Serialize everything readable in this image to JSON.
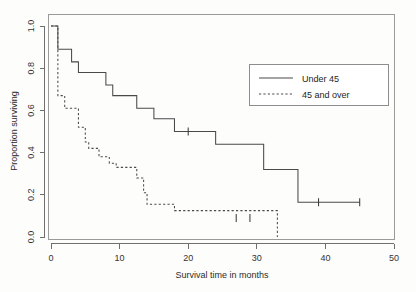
{
  "chart_data": {
    "type": "line",
    "title": "",
    "xlabel": "Survival time in months",
    "ylabel": "Proportion surviving",
    "xlim": [
      0,
      50
    ],
    "ylim": [
      0.0,
      1.0
    ],
    "xticks": [
      0,
      10,
      20,
      30,
      40,
      50
    ],
    "xtick_labels": [
      "0",
      "10",
      "20",
      "30",
      "40",
      "50"
    ],
    "yticks": [
      0.0,
      0.2,
      0.4,
      0.6,
      0.8,
      1.0
    ],
    "ytick_labels": [
      "0.0",
      "0.2",
      "0.4",
      "0.6",
      "0.8",
      "1.0"
    ],
    "grid": false,
    "legend_position": "top-right",
    "step_type": "post",
    "series": [
      {
        "name": "Under 45",
        "style": "solid",
        "color": "#4a4a4a",
        "x": [
          0,
          1,
          3,
          4,
          8,
          9,
          12.5,
          15,
          18,
          24,
          31,
          36,
          45
        ],
        "y": [
          1.0,
          0.89,
          0.83,
          0.78,
          0.72,
          0.67,
          0.61,
          0.56,
          0.5,
          0.44,
          0.32,
          0.165,
          0.165
        ],
        "censored_x": [
          20,
          39,
          45
        ],
        "censored_y": [
          0.5,
          0.165,
          0.165
        ]
      },
      {
        "name": "45 and over",
        "style": "dashed",
        "color": "#4a4a4a",
        "x": [
          0,
          1,
          2,
          4,
          5,
          5.5,
          7,
          8.5,
          9.5,
          12.5,
          13.5,
          14,
          18,
          33,
          33
        ],
        "y": [
          1.0,
          0.67,
          0.61,
          0.52,
          0.45,
          0.42,
          0.38,
          0.35,
          0.33,
          0.28,
          0.21,
          0.155,
          0.125,
          0.09,
          0.0
        ],
        "censored_x": [
          27,
          29
        ],
        "censored_y": [
          0.09,
          0.09
        ]
      }
    ],
    "legend": [
      {
        "label": "Under 45",
        "style": "solid"
      },
      {
        "label": "45 and over",
        "style": "dashed"
      }
    ]
  },
  "axes": {
    "x_title": "Survival time in months",
    "y_title": "Proportion surviving",
    "x_tick_labels": [
      "0",
      "10",
      "20",
      "30",
      "40",
      "50"
    ],
    "y_tick_labels": [
      "0.0",
      "0.2",
      "0.4",
      "0.6",
      "0.8",
      "1.0"
    ]
  },
  "legend": {
    "entry_under_45": "Under 45",
    "entry_45_and_over": "45 and over"
  },
  "colors": {
    "curve": "#4a4a4a",
    "axis": "#6f6f6f",
    "frame": "#9a9a9a",
    "text": "#2b2b2b",
    "background": "#fdfdfc"
  }
}
